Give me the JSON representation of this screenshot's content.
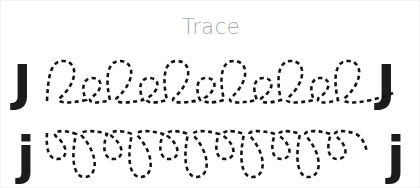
{
  "worksheet": {
    "title": "Trace",
    "background_color": "#ffffff",
    "title_color": "#a9a9ad",
    "stroke_color": "#141414",
    "letter_color": "#1c1c1c"
  },
  "rows": [
    {
      "id": "uppercase-row",
      "letter": "J",
      "letter_case": "uppercase",
      "left_label": "J",
      "right_label": "J",
      "trace_style": "cursive-loops-upward",
      "baseline_y": 100,
      "large_loop_count": 6,
      "small_loop_count": 5,
      "has_trailing_tail": true
    },
    {
      "id": "lowercase-row",
      "letter": "j",
      "letter_case": "lowercase",
      "left_label": "j",
      "right_label": "j",
      "trace_style": "cursive-loops-downward",
      "topline_y": 132,
      "long_loop_count": 5,
      "short_loop_count": 6,
      "has_trailing_tail": true
    }
  ]
}
